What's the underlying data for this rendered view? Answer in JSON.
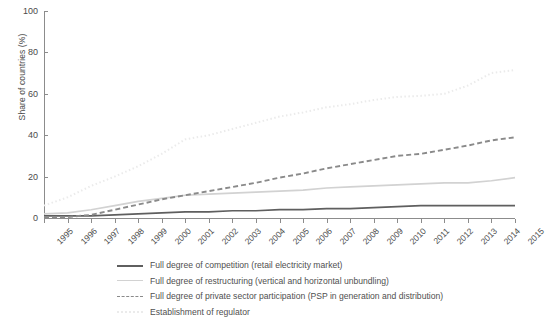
{
  "chart_data": {
    "type": "line",
    "title": "",
    "xlabel": "",
    "ylabel": "Share of countries (%)",
    "ylim": [
      0,
      100
    ],
    "yticks": [
      0,
      20,
      40,
      60,
      80,
      100
    ],
    "grid": false,
    "legend_position": "below",
    "x": [
      1995,
      1996,
      1997,
      1998,
      1999,
      2000,
      2001,
      2002,
      2003,
      2004,
      2005,
      2006,
      2007,
      2008,
      2009,
      2010,
      2011,
      2012,
      2013,
      2014,
      2015
    ],
    "categories": [
      "1995",
      "1996",
      "1997",
      "1998",
      "1999",
      "2000",
      "2001",
      "2002",
      "2003",
      "2004",
      "2005",
      "2006",
      "2007",
      "2008",
      "2009",
      "2010",
      "2011",
      "2012",
      "2013",
      "2014",
      "2015"
    ],
    "series": [
      {
        "name": "Full degree of competition (retail electricity market)",
        "style": "solid",
        "color": "#5f5f5f",
        "values": [
          1,
          1,
          1,
          1.5,
          2,
          2.5,
          3,
          3,
          3.5,
          3.5,
          4,
          4,
          4.5,
          4.5,
          5,
          5.5,
          6,
          6,
          6,
          6,
          6
        ]
      },
      {
        "name": "Full degree of restructuring (vertical and horizontal unbundling)",
        "style": "solid",
        "color": "#d2d2d2",
        "values": [
          2,
          2.5,
          4,
          6,
          8,
          9.5,
          11,
          11.5,
          12,
          12.5,
          13,
          13.5,
          14.5,
          15,
          15.5,
          16,
          16.5,
          17,
          17,
          18,
          19.5
        ]
      },
      {
        "name": "Full degree of private sector participation (PSP in generation and distribution)",
        "style": "dashed",
        "color": "#8a8a8a",
        "values": [
          0.5,
          0.5,
          1.5,
          4,
          6.5,
          9,
          11,
          13,
          15,
          17,
          19.5,
          21.5,
          24,
          26,
          28,
          30,
          31,
          33,
          35,
          37.5,
          39
        ]
      },
      {
        "name": "Establishment of regulator",
        "style": "dotted",
        "color": "#ebebeb",
        "values": [
          6,
          10,
          15.5,
          20,
          25,
          31,
          38,
          40,
          43,
          46,
          49,
          51,
          53.5,
          55,
          57,
          58.5,
          59,
          60,
          64,
          70,
          71.5
        ]
      }
    ]
  },
  "legend": {
    "items": [
      {
        "label": "Full degree of competition (retail electricity market)"
      },
      {
        "label": "Full degree of restructuring (vertical and horizontal unbundling)"
      },
      {
        "label": "Full degree of private sector participation (PSP in generation and distribution)"
      },
      {
        "label": "Establishment of regulator"
      }
    ]
  }
}
